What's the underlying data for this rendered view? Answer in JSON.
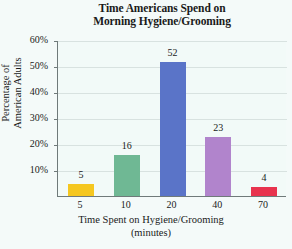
{
  "chart_data": {
    "type": "bar",
    "title": "Time Americans Spend on Morning Hygiene/Grooming",
    "title_line1": "Time Americans Spend on",
    "title_line2": "Morning Hygiene/Grooming",
    "xlabel": "Time Spent on Hygiene/Grooming (minutes)",
    "xlabel_line1": "Time Spent on Hygiene/Grooming",
    "xlabel_line2": "(minutes)",
    "ylabel": "Percentage of American Adults",
    "ylabel_line1": "Percentage of",
    "ylabel_line2": "American Adults",
    "categories": [
      "5",
      "10",
      "20",
      "40",
      "70"
    ],
    "values": [
      5,
      16,
      52,
      23,
      4
    ],
    "value_labels": [
      "5",
      "16",
      "52",
      "23",
      "4"
    ],
    "ylim": [
      0,
      60
    ],
    "ytick_labels": [
      "60%",
      "50%",
      "40%",
      "30%",
      "20%",
      "10%"
    ],
    "ytick_values": [
      60,
      50,
      40,
      30,
      20,
      10
    ],
    "grid": true,
    "legend": "none",
    "bar_colors": [
      "#f5c720",
      "#6fb894",
      "#5a74c8",
      "#b184cc",
      "#e8334e"
    ],
    "axis_color": "#6f7a7a",
    "grid_color": "#d8e2e0",
    "plot_background": "#f2faf8",
    "page_background": "#f4faf9"
  }
}
